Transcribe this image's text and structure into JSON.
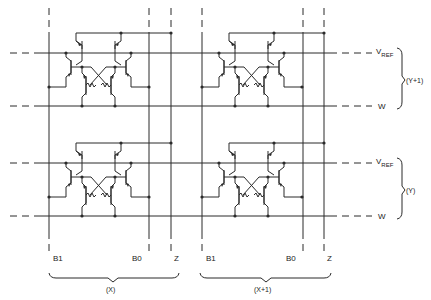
{
  "diagram": {
    "type": "bipolar memory cell array schematic",
    "rows": [
      {
        "label": "(Y+1)",
        "vref_label": "V",
        "vref_sub": "REF",
        "word_label": "W"
      },
      {
        "label": "(Y)",
        "vref_label": "V",
        "vref_sub": "REF",
        "word_label": "W"
      }
    ],
    "columns": [
      {
        "label": "(X)",
        "b1": "B1",
        "b0": "B0",
        "z": "Z"
      },
      {
        "label": "(X+1)",
        "b1": "B1",
        "b0": "B0",
        "z": "Z"
      }
    ],
    "colors": {
      "ink": "#2a2a2a",
      "background": "#ffffff"
    }
  }
}
